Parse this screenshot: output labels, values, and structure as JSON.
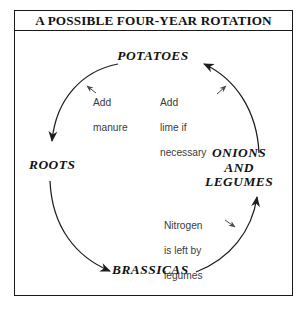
{
  "figure": {
    "title": "A POSSIBLE FOUR-YEAR ROTATION",
    "frame_color": "#1a1a1a",
    "background": "#ffffff",
    "ink_color": "#121212"
  },
  "cycle": {
    "direction": "clockwise-by-arrows: potatoes to roots to brassicas to onions and legumes to potatoes",
    "stages": [
      {
        "id": "potatoes",
        "label": "POTATOES",
        "position": "top"
      },
      {
        "id": "roots",
        "label": "ROOTS",
        "position": "left"
      },
      {
        "id": "brassicas",
        "label": "BRASSICAS",
        "position": "bottom"
      },
      {
        "id": "onions",
        "label": "ONIONS\nAND\nLEGUMES",
        "line1": "ONIONS",
        "line2": "AND",
        "line3": "LEGUMES",
        "position": "right"
      }
    ],
    "arrows": [
      {
        "id": "potatoes-to-roots",
        "from": "potatoes",
        "to": "roots"
      },
      {
        "id": "roots-to-brassicas",
        "from": "roots",
        "to": "brassicas"
      },
      {
        "id": "brassicas-to-onions",
        "from": "brassicas",
        "to": "onions"
      },
      {
        "id": "onions-to-potatoes",
        "from": "onions",
        "to": "potatoes"
      }
    ]
  },
  "annotations": [
    {
      "id": "add-manure",
      "text": "Add\nmanure",
      "line1": "Add",
      "line2": "manure",
      "points_to": "potatoes-to-roots"
    },
    {
      "id": "add-lime",
      "text": "Add\nlime if\nnecessary",
      "line1": "Add",
      "line2": "lime if",
      "line3": "necessary",
      "points_to": "onions-to-potatoes"
    },
    {
      "id": "nitrogen",
      "text": "Nitrogen\nis left by\nlegumes",
      "line1": "Nitrogen",
      "line2": "is left by",
      "line3": "legumes",
      "points_to": "brassicas-to-onions"
    }
  ]
}
